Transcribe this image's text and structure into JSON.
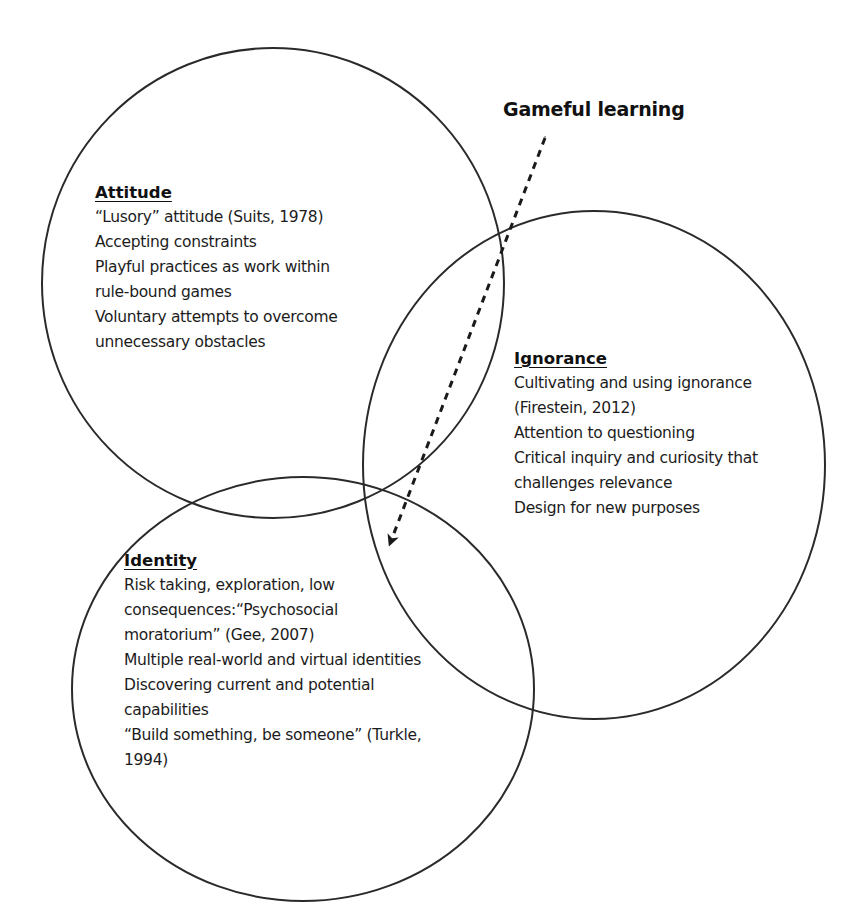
{
  "diagram": {
    "type": "venn",
    "title": "Gameful learning",
    "arrow": {
      "style": "dashed",
      "from_label": "Gameful learning",
      "points_to": "center intersection of the three circles"
    },
    "circles": [
      {
        "id": "attitude",
        "heading": "Attitude",
        "lines": [
          "“Lusory” attitude (Suits, 1978)",
          "Accepting constraints",
          "Playful practices as work within",
          "rule-bound games",
          "Voluntary attempts to overcome",
          "unnecessary obstacles"
        ]
      },
      {
        "id": "ignorance",
        "heading": "Ignorance",
        "lines": [
          "Cultivating and using ignorance",
          "(Firestein, 2012)",
          "Attention to questioning",
          "Critical inquiry and curiosity that",
          "challenges relevance",
          "Design for new purposes"
        ]
      },
      {
        "id": "identity",
        "heading": "Identity",
        "lines": [
          "Risk taking, exploration, low",
          "consequences:“Psychosocial",
          "moratorium” (Gee, 2007)",
          "Multiple real-world and virtual identities",
          "Discovering current and potential",
          "capabilities",
          "“Build something, be someone” (Turkle,",
          "1994)"
        ]
      }
    ],
    "colors": {
      "stroke": "#2a2a2a",
      "text": "#1c1c1c",
      "background": "#ffffff"
    }
  }
}
